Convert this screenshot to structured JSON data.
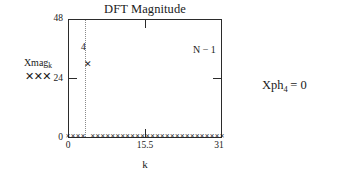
{
  "chart_data": {
    "type": "scatter",
    "title": "DFT Magnitude",
    "xlabel": "k",
    "ylabel": "",
    "xlim": [
      0,
      31
    ],
    "ylim": [
      0,
      48
    ],
    "xticks": [
      "0",
      "15.5",
      "31"
    ],
    "yticks": [
      "48",
      "24",
      "0"
    ],
    "grid": false,
    "legend_position": "left-outside",
    "series": [
      {
        "name": "Xmag",
        "name_subscript": "k",
        "marker": "x",
        "x": [
          0,
          1,
          2,
          3,
          4,
          5,
          6,
          7,
          8,
          9,
          10,
          11,
          12,
          13,
          14,
          15,
          16,
          17,
          18,
          19,
          20,
          21,
          22,
          23,
          24,
          25,
          26,
          27,
          28,
          29,
          30,
          31
        ],
        "values": [
          1.0,
          1.0,
          1.0,
          1.0,
          30.0,
          1.0,
          1.0,
          1.0,
          1.0,
          1.0,
          1.0,
          1.0,
          1.0,
          1.0,
          1.0,
          1.0,
          1.0,
          1.0,
          1.0,
          1.0,
          1.0,
          1.0,
          1.0,
          1.0,
          1.0,
          1.0,
          1.0,
          1.0,
          1.0,
          1.0,
          1.0,
          1.0
        ]
      }
    ],
    "annotations": [
      {
        "name": "peak-index",
        "text": "4",
        "x": 4,
        "y": 39
      },
      {
        "name": "last-index",
        "text": "N − 1",
        "x": 31,
        "y": 38
      }
    ],
    "guide_lines": [
      {
        "name": "k4-guide",
        "x": 4,
        "style": "dotted"
      }
    ]
  },
  "legend": {
    "label": "Xmag",
    "subscript": "k",
    "marks": "✕✕✕"
  },
  "side_note": {
    "prefix": "Xph",
    "subscript": "4",
    "equals": " = 0"
  }
}
